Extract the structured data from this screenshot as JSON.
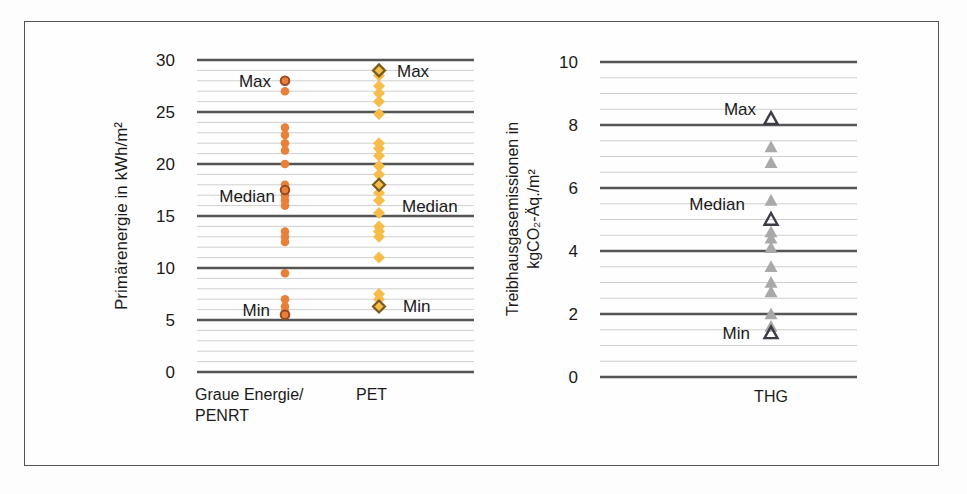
{
  "chart_data": [
    {
      "type": "scatter",
      "title": "",
      "ylabel": "Primärenergie  in kWh/m²",
      "xlabel": "",
      "ylim": [
        0,
        30
      ],
      "yticks": [
        0,
        5,
        10,
        15,
        20,
        25,
        30
      ],
      "minor_grid_step": 1,
      "grid": true,
      "categories": [
        "Graue Energie/ PENRT",
        "PET"
      ],
      "series": [
        {
          "name": "Graue Energie/ PENRT",
          "marker": "circle",
          "color": "#e8803a",
          "highlight_color": "#9a4a1e",
          "values": [
            28,
            27,
            23.5,
            22.8,
            22,
            21.3,
            20,
            18,
            17.5,
            17,
            16.5,
            16,
            13.5,
            13,
            12.5,
            9.5,
            7,
            6.3,
            5.8,
            5.5
          ],
          "max": 28,
          "median": 17.5,
          "min": 5.5
        },
        {
          "name": "PET",
          "marker": "diamond",
          "color": "#f6bd4a",
          "highlight_color": "#7a5a1c",
          "values": [
            29,
            28.5,
            27.5,
            26.8,
            26,
            24.8,
            22,
            21.5,
            20.8,
            19.8,
            19,
            18,
            17.2,
            16.5,
            15.3,
            14,
            13.5,
            13,
            11,
            7.5,
            7,
            6.3
          ],
          "max": 29,
          "median": 18,
          "min": 6.3
        }
      ],
      "annotations": [
        {
          "text": "Max",
          "series": "Graue Energie/ PENRT",
          "side": "left"
        },
        {
          "text": "Median",
          "series": "Graue Energie/ PENRT",
          "side": "left"
        },
        {
          "text": "Min",
          "series": "Graue Energie/ PENRT",
          "side": "left"
        },
        {
          "text": "Max",
          "series": "PET",
          "side": "right"
        },
        {
          "text": "Median",
          "series": "PET",
          "side": "right"
        },
        {
          "text": "Min",
          "series": "PET",
          "side": "right"
        }
      ]
    },
    {
      "type": "scatter",
      "title": "",
      "ylabel_line1": "Treibhausgasemissionen in",
      "ylabel_line2": "kgCO₂-Äq./m²",
      "xlabel": "",
      "ylim": [
        0,
        10
      ],
      "yticks": [
        0,
        2,
        4,
        6,
        8,
        10
      ],
      "minor_grid_step": 0.5,
      "grid": true,
      "categories": [
        "THG"
      ],
      "series": [
        {
          "name": "THG",
          "marker": "triangle",
          "color": "#a9a9a9",
          "highlight_color": "#3c3c46",
          "values": [
            8.2,
            7.3,
            6.8,
            5.6,
            5.0,
            4.6,
            4.4,
            4.1,
            3.5,
            3.0,
            2.7,
            2.0,
            1.6,
            1.4
          ],
          "max": 8.2,
          "median": 5.0,
          "min": 1.4
        }
      ],
      "annotations": [
        {
          "text": "Max",
          "series": "THG",
          "side": "left"
        },
        {
          "text": "Median",
          "series": "THG",
          "side": "left"
        },
        {
          "text": "Min",
          "series": "THG",
          "side": "left"
        }
      ]
    }
  ],
  "labels": {
    "max": "Max",
    "median": "Median",
    "min": "Min",
    "cat_left_line1": "Graue Energie/",
    "cat_left_line2": "PENRT",
    "cat_pet": "PET",
    "cat_thg": "THG"
  },
  "caption_partial": "Abbildung: Übersicht ... (text cut off at bottom edge)"
}
